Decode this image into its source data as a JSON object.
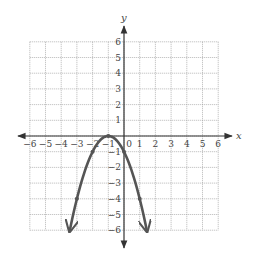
{
  "chart_data": {
    "type": "line",
    "title": "",
    "xlabel": "x",
    "ylabel": "y",
    "xlim": [
      -6,
      6
    ],
    "ylim": [
      -6,
      6
    ],
    "grid": true,
    "grid_style": "dotted",
    "x_ticks": [
      -6,
      -5,
      -4,
      -3,
      -2,
      -1,
      0,
      1,
      2,
      3,
      4,
      5,
      6
    ],
    "y_ticks": [
      -6,
      -5,
      -4,
      -3,
      -2,
      -1,
      1,
      2,
      3,
      4,
      5,
      6
    ],
    "x_tick_labels": [
      "−6",
      "−5",
      "−4",
      "−3",
      "−2",
      "−1",
      "0",
      "1",
      "2",
      "3",
      "4",
      "5",
      "6"
    ],
    "y_tick_labels": [
      "−6",
      "−5",
      "−4",
      "−3",
      "−2",
      "−1",
      "1",
      "2",
      "3",
      "4",
      "5",
      "6"
    ],
    "series": [
      {
        "name": "parabola",
        "equation": "y = -(x+1)^2",
        "color": "#555555",
        "points": [
          {
            "x": -3,
            "y": -4
          },
          {
            "x": -2,
            "y": -1
          },
          {
            "x": -1,
            "y": 0
          },
          {
            "x": 0,
            "y": -1
          },
          {
            "x": 1,
            "y": -4
          }
        ],
        "arrows_at_ends": true,
        "x_range": [
          -3.45,
          1.45
        ]
      }
    ]
  },
  "colors": {
    "axis": "#333333",
    "grid": "#9a9a9a",
    "curve": "#555555",
    "text": "#444444"
  },
  "geometry": {
    "origin_x": 124,
    "origin_y": 136,
    "unit": 15.7
  }
}
